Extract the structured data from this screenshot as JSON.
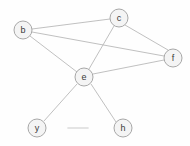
{
  "graph": {
    "title": "undirected-node-link-graph",
    "background_color": "#fefefe",
    "node_fill_color": "#f4f4f4",
    "node_stroke_color": "#9e9e9e",
    "edge_color": "#b9b9b9",
    "label_color": "#3a3a3a",
    "node_radius": 9,
    "nodes": [
      {
        "id": "b",
        "label": "b",
        "cx": 23,
        "cy": 30
      },
      {
        "id": "c",
        "label": "c",
        "cx": 119,
        "cy": 18
      },
      {
        "id": "f",
        "label": "f",
        "cx": 173,
        "cy": 58
      },
      {
        "id": "e",
        "label": "e",
        "cx": 84,
        "cy": 77
      },
      {
        "id": "y",
        "label": "y",
        "cx": 37,
        "cy": 128
      },
      {
        "id": "h",
        "label": "h",
        "cx": 123,
        "cy": 128
      }
    ],
    "edges": [
      {
        "source": "b",
        "target": "c",
        "x1": 32,
        "y1": 29,
        "x2": 110,
        "y2": 19
      },
      {
        "source": "b",
        "target": "f",
        "x1": 32,
        "y1": 32,
        "x2": 164,
        "y2": 56
      },
      {
        "source": "b",
        "target": "e",
        "x1": 30,
        "y1": 36,
        "x2": 77,
        "y2": 72
      },
      {
        "source": "c",
        "target": "f",
        "x1": 125,
        "y1": 25,
        "x2": 168,
        "y2": 50
      },
      {
        "source": "c",
        "target": "e",
        "x1": 114,
        "y1": 26,
        "x2": 89,
        "y2": 69
      },
      {
        "source": "e",
        "target": "f",
        "x1": 93,
        "y1": 74,
        "x2": 164,
        "y2": 60
      },
      {
        "source": "e",
        "target": "y",
        "x1": 77,
        "y1": 84,
        "x2": 44,
        "y2": 121
      },
      {
        "source": "e",
        "target": "h",
        "x1": 91,
        "y1": 84,
        "x2": 116,
        "y2": 122
      }
    ],
    "artifacts": [
      {
        "name": "faint-dash",
        "x1": 68,
        "y1": 128,
        "x2": 88,
        "y2": 128
      }
    ]
  }
}
